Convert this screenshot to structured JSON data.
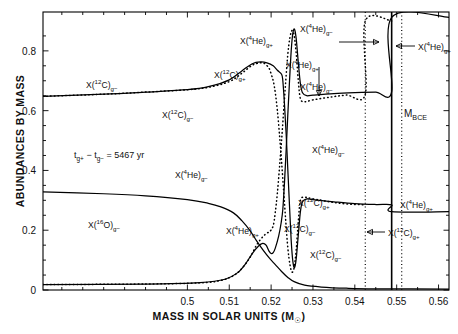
{
  "chart_data": {
    "type": "line",
    "title": "",
    "xlabel": "MASS IN SOLAR UNITS (M☉)",
    "ylabel": "ABUNDANCES BY MASS",
    "xlim": [
      0.4655,
      0.5625
    ],
    "ylim": [
      0.0,
      0.93
    ],
    "xticks": [
      "0.5",
      "0.51",
      "0.52",
      "0.53",
      "0.54",
      "0.55",
      "0.56"
    ],
    "xtick_values": [
      0.5,
      0.51,
      0.52,
      0.53,
      0.54,
      0.55,
      0.56
    ],
    "yticks": [
      "0",
      "0.2",
      "0.4",
      "0.6",
      "0.8"
    ],
    "ytick_values": [
      0,
      0.2,
      0.4,
      0.6,
      0.8
    ],
    "grid": false,
    "legend": "none (in-plot curve labels)",
    "minor_ticks": true,
    "series": [
      {
        "name": "X(12C) g-",
        "style": "dotted",
        "points": [
          [
            0.4655,
            0.648
          ],
          [
            0.48,
            0.655
          ],
          [
            0.49,
            0.662
          ],
          [
            0.5,
            0.67
          ],
          [
            0.505,
            0.678
          ],
          [
            0.51,
            0.697
          ],
          [
            0.513,
            0.725
          ],
          [
            0.5155,
            0.752
          ],
          [
            0.5175,
            0.76
          ],
          [
            0.5185,
            0.757
          ],
          [
            0.5195,
            0.742
          ],
          [
            0.52,
            0.723
          ],
          [
            0.5205,
            0.7
          ],
          [
            0.521,
            0.66
          ],
          [
            0.5215,
            0.6
          ],
          [
            0.522,
            0.52
          ],
          [
            0.5225,
            0.43
          ],
          [
            0.523,
            0.33
          ],
          [
            0.5235,
            0.23
          ],
          [
            0.524,
            0.14
          ],
          [
            0.5245,
            0.085
          ],
          [
            0.525,
            0.06
          ],
          [
            0.5255,
            0.075
          ],
          [
            0.526,
            0.135
          ],
          [
            0.5265,
            0.23
          ],
          [
            0.527,
            0.3
          ],
          [
            0.528,
            0.31
          ],
          [
            0.53,
            0.305
          ],
          [
            0.534,
            0.295
          ],
          [
            0.538,
            0.288
          ],
          [
            0.5425,
            0.285
          ]
        ]
      },
      {
        "name": "X(4He) g-",
        "style": "dotted",
        "points": [
          [
            0.4655,
            0.018
          ],
          [
            0.49,
            0.02
          ],
          [
            0.503,
            0.024
          ],
          [
            0.508,
            0.032
          ],
          [
            0.511,
            0.048
          ],
          [
            0.513,
            0.072
          ],
          [
            0.515,
            0.11
          ],
          [
            0.5165,
            0.15
          ],
          [
            0.518,
            0.178
          ],
          [
            0.519,
            0.19
          ],
          [
            0.5197,
            0.196
          ],
          [
            0.5205,
            0.215
          ],
          [
            0.521,
            0.26
          ],
          [
            0.5215,
            0.325
          ],
          [
            0.522,
            0.41
          ],
          [
            0.5225,
            0.5
          ],
          [
            0.523,
            0.6
          ],
          [
            0.5235,
            0.7
          ],
          [
            0.524,
            0.79
          ],
          [
            0.5245,
            0.845
          ],
          [
            0.525,
            0.868
          ],
          [
            0.5255,
            0.852
          ],
          [
            0.526,
            0.79
          ],
          [
            0.5265,
            0.7
          ],
          [
            0.527,
            0.64
          ],
          [
            0.528,
            0.63
          ],
          [
            0.53,
            0.636
          ],
          [
            0.534,
            0.645
          ],
          [
            0.538,
            0.652
          ],
          [
            0.5425,
            0.655
          ],
          [
            0.5425,
            0.9
          ],
          [
            0.5488,
            0.9
          ]
        ]
      },
      {
        "name": "X(12C) g+",
        "style": "solid",
        "points": [
          [
            0.4655,
            0.648
          ],
          [
            0.48,
            0.655
          ],
          [
            0.49,
            0.662
          ],
          [
            0.5,
            0.67
          ],
          [
            0.505,
            0.68
          ],
          [
            0.51,
            0.703
          ],
          [
            0.513,
            0.733
          ],
          [
            0.5155,
            0.757
          ],
          [
            0.5175,
            0.763
          ],
          [
            0.519,
            0.76
          ],
          [
            0.5205,
            0.75
          ],
          [
            0.5215,
            0.735
          ],
          [
            0.5225,
            0.722
          ],
          [
            0.5228,
            0.7
          ],
          [
            0.5232,
            0.62
          ],
          [
            0.5236,
            0.52
          ],
          [
            0.524,
            0.4
          ],
          [
            0.5244,
            0.28
          ],
          [
            0.5248,
            0.165
          ],
          [
            0.5252,
            0.095
          ],
          [
            0.5256,
            0.075
          ],
          [
            0.526,
            0.105
          ],
          [
            0.5265,
            0.185
          ],
          [
            0.527,
            0.262
          ],
          [
            0.5275,
            0.295
          ],
          [
            0.5285,
            0.305
          ],
          [
            0.53,
            0.302
          ],
          [
            0.535,
            0.295
          ],
          [
            0.54,
            0.289
          ],
          [
            0.545,
            0.286
          ],
          [
            0.5488,
            0.285
          ],
          [
            0.5488,
            0.262
          ],
          [
            0.5625,
            0.262
          ]
        ]
      },
      {
        "name": "X(4He) g+",
        "style": "solid",
        "points": [
          [
            0.4655,
            0.018
          ],
          [
            0.49,
            0.02
          ],
          [
            0.503,
            0.025
          ],
          [
            0.509,
            0.036
          ],
          [
            0.512,
            0.058
          ],
          [
            0.514,
            0.09
          ],
          [
            0.5155,
            0.122
          ],
          [
            0.517,
            0.147
          ],
          [
            0.518,
            0.156
          ],
          [
            0.5188,
            0.15
          ],
          [
            0.5195,
            0.13
          ],
          [
            0.52,
            0.122
          ],
          [
            0.5205,
            0.125
          ],
          [
            0.521,
            0.14
          ],
          [
            0.5218,
            0.18
          ],
          [
            0.5224,
            0.225
          ],
          [
            0.5228,
            0.27
          ],
          [
            0.5232,
            0.36
          ],
          [
            0.5236,
            0.47
          ],
          [
            0.524,
            0.59
          ],
          [
            0.5244,
            0.7
          ],
          [
            0.5248,
            0.8
          ],
          [
            0.5252,
            0.86
          ],
          [
            0.5256,
            0.872
          ],
          [
            0.526,
            0.84
          ],
          [
            0.5265,
            0.76
          ],
          [
            0.527,
            0.69
          ],
          [
            0.5275,
            0.66
          ],
          [
            0.5285,
            0.65
          ],
          [
            0.53,
            0.652
          ],
          [
            0.535,
            0.657
          ],
          [
            0.54,
            0.66
          ],
          [
            0.545,
            0.662
          ],
          [
            0.5488,
            0.663
          ],
          [
            0.5488,
            0.912
          ],
          [
            0.5625,
            0.912
          ]
        ]
      },
      {
        "name": "X(16O) g-",
        "style": "solid",
        "points": [
          [
            0.4655,
            0.328
          ],
          [
            0.48,
            0.322
          ],
          [
            0.49,
            0.315
          ],
          [
            0.5,
            0.302
          ],
          [
            0.505,
            0.29
          ],
          [
            0.508,
            0.278
          ],
          [
            0.511,
            0.258
          ],
          [
            0.513,
            0.232
          ],
          [
            0.515,
            0.198
          ],
          [
            0.5165,
            0.165
          ],
          [
            0.518,
            0.135
          ],
          [
            0.5195,
            0.108
          ],
          [
            0.521,
            0.085
          ],
          [
            0.5225,
            0.062
          ],
          [
            0.524,
            0.042
          ],
          [
            0.5255,
            0.028
          ],
          [
            0.528,
            0.016
          ],
          [
            0.532,
            0.01
          ],
          [
            0.538,
            0.006
          ],
          [
            0.545,
            0.004
          ],
          [
            0.5625,
            0.003
          ]
        ]
      }
    ],
    "vertical_markers": [
      {
        "name": "inner-dotted-boundary",
        "x": 0.5425,
        "style": "dotted"
      },
      {
        "name": "shell-edge",
        "x": 0.5488,
        "style": "solid"
      },
      {
        "name": "M_BCE",
        "x": 0.5512,
        "style": "dotted"
      }
    ]
  },
  "annotations": {
    "timescale": "tᵍ₊ − tᵍ₋ = 5467 yr",
    "timescale_plain": "tg+ - tg- = 5467 yr",
    "mbce": "M",
    "mbce_sub": "BCE"
  },
  "curve_labels": [
    {
      "id": "c12-gminus-left",
      "base": "X(",
      "iso_sup": "12",
      "iso": "C)",
      "sub": "g−"
    },
    {
      "id": "c12-gplus-upper",
      "base": "X(",
      "iso_sup": "12",
      "iso": "C)",
      "sub": "g+"
    },
    {
      "id": "c12-gminus-mid",
      "base": "X(",
      "iso_sup": "12",
      "iso": "C)",
      "sub": "g−"
    },
    {
      "id": "he4-gminus-mid",
      "base": "X(",
      "iso_sup": "4",
      "iso": "He)",
      "sub": "g−"
    },
    {
      "id": "he4-gplus-low",
      "base": "X(",
      "iso_sup": "4",
      "iso": "He)",
      "sub": "g+"
    },
    {
      "id": "o16-gminus",
      "base": "X(",
      "iso_sup": "16",
      "iso": "O)",
      "sub": "g−"
    },
    {
      "id": "he4-gminus-top",
      "base": "X(",
      "iso_sup": "4",
      "iso": "He)",
      "sub": "g−"
    },
    {
      "id": "he4-gplus-arrowdown",
      "base": "X(",
      "iso_sup": "4",
      "iso": "He)",
      "sub": "g+"
    },
    {
      "id": "he4-gplus-arrowright",
      "base": "X(",
      "iso_sup": "4",
      "iso": "He)",
      "sub": "g+"
    },
    {
      "id": "he4-gplus-right",
      "base": "X(",
      "iso_sup": "4",
      "iso": "He)",
      "sub": "g+"
    },
    {
      "id": "he4-gminus-plateau",
      "base": "X(",
      "iso_sup": "4",
      "iso": "He)",
      "sub": "g−"
    },
    {
      "id": "he4-gminus-right",
      "base": "X(",
      "iso_sup": "4",
      "iso": "He)",
      "sub": "g−"
    },
    {
      "id": "c12-gplus-lowmid",
      "base": "X(",
      "iso_sup": "12",
      "iso": "C)",
      "sub": "g+"
    },
    {
      "id": "c12-gminus-low",
      "base": "X(",
      "iso_sup": "12",
      "iso": "C)",
      "sub": "g−"
    },
    {
      "id": "c12-gminus-low2",
      "base": "X(",
      "iso_sup": "12",
      "iso": "C)",
      "sub": "g−"
    },
    {
      "id": "he4-gplus-farright",
      "base": "X(",
      "iso_sup": "4",
      "iso": "He)",
      "sub": "g+"
    },
    {
      "id": "c12-gplus-farright",
      "base": "X(",
      "iso_sup": "12",
      "iso": "C)",
      "sub": "g+"
    }
  ],
  "axes": {
    "xlabel_main": "MASS IN SOLAR UNITS (M",
    "xlabel_sub": "☉",
    "xlabel_close": ")",
    "ylabel": "ABUNDANCES BY MASS"
  }
}
